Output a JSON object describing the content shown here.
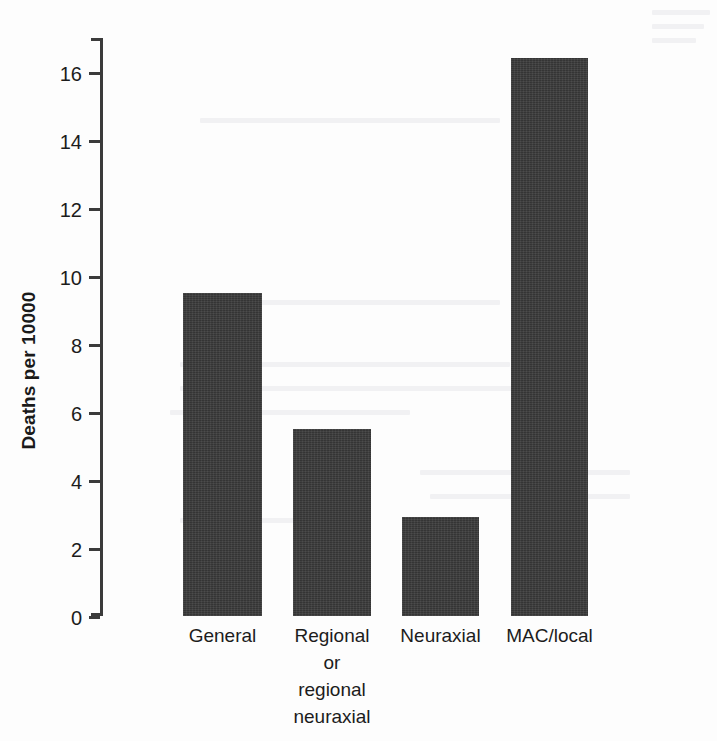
{
  "figure": {
    "background_color": "#fdfdfd",
    "bar_color": "#3a3a3a",
    "axis_color": "#3b3b3b"
  },
  "chart_data": {
    "type": "bar",
    "title": "",
    "subtitle": "",
    "xlabel": "",
    "ylabel": "Deaths per 10000",
    "categories": [
      "General",
      "Regional or regional neuraxial",
      "Neuraxial",
      "MAC/local"
    ],
    "category_lines": [
      [
        "General"
      ],
      [
        "Regional",
        "or",
        "regional",
        "neuraxial"
      ],
      [
        "Neuraxial"
      ],
      [
        "MAC/local"
      ]
    ],
    "values": [
      9.5,
      5.5,
      2.9,
      16.4
    ],
    "ylim": [
      0,
      17
    ],
    "yticks": [
      0,
      2,
      4,
      6,
      8,
      10,
      12,
      14,
      16
    ],
    "ytick_labels": [
      "0",
      "2",
      "4",
      "6",
      "8",
      "10",
      "12",
      "14",
      "16"
    ],
    "grid": false,
    "legend": false,
    "legend_position": "none",
    "bar_color": "#3a3a3a",
    "orientation": "vertical"
  }
}
